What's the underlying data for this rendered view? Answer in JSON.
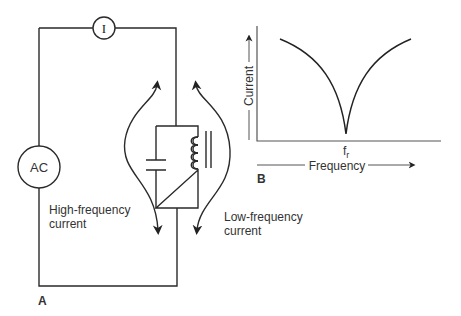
{
  "panel_a": {
    "label": "A",
    "ammeter_label": "I",
    "source_label": "AC",
    "high_freq_label_line1": "High-frequency",
    "high_freq_label_line2": "current",
    "low_freq_label_line1": "Low-frequency",
    "low_freq_label_line2": "current"
  },
  "panel_b": {
    "label": "B",
    "y_axis_label": "Current",
    "x_axis_label": "Frequency",
    "resonance_label": "f",
    "resonance_subscript": "r"
  },
  "colors": {
    "line": "#2a2a2a",
    "axis": "#555555",
    "text": "#333333"
  }
}
